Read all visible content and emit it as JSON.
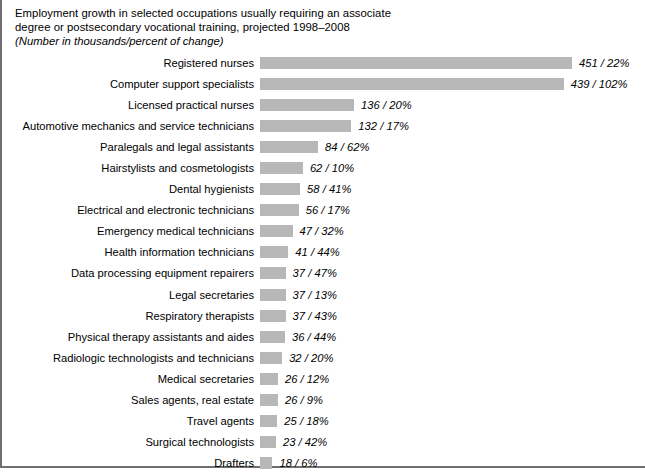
{
  "heading": {
    "title_line1": "Employment growth in selected occupations usually requiring an associate",
    "title_line2": "degree or postsecondary vocational training, projected 1998–2008",
    "subtitle": "(Number in thousands/percent of change)"
  },
  "style": {
    "bar_color": "#b7b7b7",
    "border_color": "#6f6f6f",
    "background": "#ffffff"
  },
  "chart_data": {
    "type": "bar",
    "orientation": "horizontal",
    "title": "Employment growth in selected occupations usually requiring an associate degree or postsecondary vocational training, projected 1998–2008",
    "subtitle": "(Number in thousands/percent of change)",
    "xlabel": "",
    "ylabel": "",
    "xlim": [
      0,
      460
    ],
    "grid": false,
    "legend": null,
    "value_unit": "thousands",
    "percent_unit": "percent of change",
    "categories": [
      "Registered nurses",
      "Computer support specialists",
      "Licensed practical nurses",
      "Automotive mechanics and service technicians",
      "Paralegals and legal assistants",
      "Hairstylists and cosmetologists",
      "Dental hygienists",
      "Electrical and electronic technicians",
      "Emergency medical technicians",
      "Health information technicians",
      "Data processing equipment repairers",
      "Legal secretaries",
      "Respiratory therapists",
      "Physical therapy assistants and aides",
      "Radiologic technologists and technicians",
      "Medical secretaries",
      "Sales agents, real estate",
      "Travel agents",
      "Surgical technologists",
      "Drafters"
    ],
    "values": [
      451,
      439,
      136,
      132,
      84,
      62,
      58,
      56,
      47,
      41,
      37,
      37,
      37,
      36,
      32,
      26,
      26,
      25,
      23,
      18
    ],
    "percents": [
      22,
      102,
      20,
      17,
      62,
      10,
      41,
      17,
      32,
      44,
      47,
      13,
      43,
      44,
      20,
      12,
      9,
      18,
      42,
      6
    ],
    "data_labels": [
      "451 / 22%",
      "439 / 102%",
      "136 / 20%",
      "132 / 17%",
      "84 / 62%",
      "62 / 10%",
      "58 / 41%",
      "56 / 17%",
      "47 / 32%",
      "41 / 44%",
      "37 / 47%",
      "37 / 13%",
      "37 / 43%",
      "36 / 44%",
      "32 / 20%",
      "26 / 12%",
      "26 / 9%",
      "25 / 18%",
      "23 / 42%",
      "18 / 6%"
    ]
  }
}
